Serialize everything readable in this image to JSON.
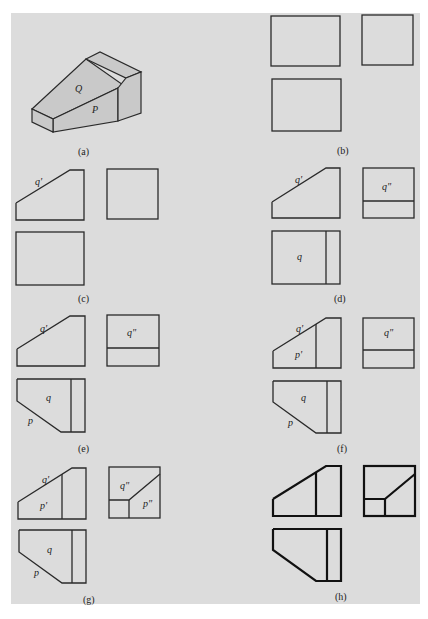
{
  "figure": {
    "panels": [
      {
        "id": "a",
        "caption": "(a)",
        "labels": {
          "Q": "Q",
          "P": "P"
        }
      },
      {
        "id": "b",
        "caption": "(b)"
      },
      {
        "id": "c",
        "caption": "(c)",
        "labels": {
          "q_front": "q'"
        }
      },
      {
        "id": "d",
        "caption": "(d)",
        "labels": {
          "q_front": "q'",
          "q_side": "q\"",
          "q_top": "q"
        }
      },
      {
        "id": "e",
        "caption": "(e)",
        "labels": {
          "q_front": "q'",
          "q_side": "q\"",
          "q_top": "q",
          "p_top": "p"
        }
      },
      {
        "id": "f",
        "caption": "(f)",
        "labels": {
          "q_front": "q'",
          "p_front": "p'",
          "q_side": "q\"",
          "q_top": "q",
          "p_top": "p"
        }
      },
      {
        "id": "g",
        "caption": "(g)",
        "labels": {
          "q_front": "q'",
          "p_front": "p'",
          "q_side": "q\"",
          "p_side": "p\"",
          "q_top": "q",
          "p_top": "p"
        }
      },
      {
        "id": "h",
        "caption": "(h)"
      }
    ],
    "colors": {
      "background": "#dcdcdc",
      "line": "#2a2a2a",
      "face": "#c9c9c9"
    }
  }
}
